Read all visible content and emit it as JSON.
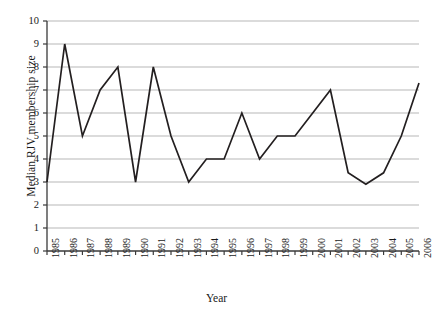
{
  "chart_data": {
    "type": "line",
    "title": "",
    "xlabel": "Year",
    "ylabel": "Median RJV membership size",
    "xlim": [
      1985,
      2006
    ],
    "ylim": [
      0,
      10
    ],
    "grid": true,
    "legend": "none",
    "categories": [
      "1985",
      "1986",
      "1987",
      "1988",
      "1989",
      "1990",
      "1991",
      "1992",
      "1993",
      "1994",
      "1995",
      "1996",
      "1997",
      "1998",
      "1999",
      "2000",
      "2001",
      "2002",
      "2003",
      "2004",
      "2005",
      "2006"
    ],
    "x": [
      1985,
      1986,
      1987,
      1988,
      1989,
      1990,
      1991,
      1992,
      1993,
      1994,
      1995,
      1996,
      1997,
      1998,
      1999,
      2000,
      2001,
      2002,
      2003,
      2004,
      2005,
      2006
    ],
    "values": [
      3,
      9,
      5,
      7,
      8,
      3,
      8,
      5,
      3,
      4,
      4,
      6,
      4,
      5,
      5,
      6,
      7,
      3.4,
      2.9,
      3.4,
      5,
      7.3
    ],
    "series": [
      {
        "name": "Median RJV membership size",
        "color": "#231f20",
        "values": [
          3,
          9,
          5,
          7,
          8,
          3,
          8,
          5,
          3,
          4,
          4,
          6,
          4,
          5,
          5,
          6,
          7,
          3.4,
          2.9,
          3.4,
          5,
          7.3
        ]
      }
    ],
    "ytick_labels": [
      "0",
      "1",
      "2",
      "3",
      "4",
      "5",
      "6",
      "7",
      "8",
      "9",
      "10"
    ],
    "ytick_values": [
      0,
      1,
      2,
      3,
      4,
      5,
      6,
      7,
      8,
      9,
      10
    ],
    "grid_color": "#b7b7b7",
    "axis_color": "#3a3a3a",
    "line_color": "#231f20"
  }
}
